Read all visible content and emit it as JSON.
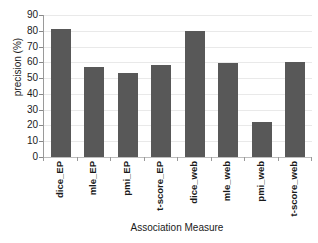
{
  "chart_data": {
    "type": "bar",
    "title": "",
    "xlabel": "Association Measure",
    "ylabel": "precision (%)",
    "categories": [
      "dice_EP",
      "mle_EP",
      "pmi_EP",
      "t-score_EP",
      "dice_web",
      "mle_web",
      "pmi_web",
      "t-score_web"
    ],
    "values": [
      81,
      57,
      53,
      58.5,
      80,
      59.5,
      22.5,
      60.5
    ],
    "ylim": [
      0,
      90
    ],
    "ytick_labels": [
      "90",
      "80",
      "70",
      "60",
      "50",
      "40",
      "30",
      "20",
      "10",
      "0"
    ],
    "ytick_values": [
      90,
      80,
      70,
      60,
      50,
      40,
      30,
      20,
      10,
      0
    ],
    "grid": true,
    "legend": false,
    "bar_color": "#585858",
    "grid_color": "#e9e9e9",
    "axis_color": "#9a9a9a",
    "background_color": "#ffffff"
  }
}
